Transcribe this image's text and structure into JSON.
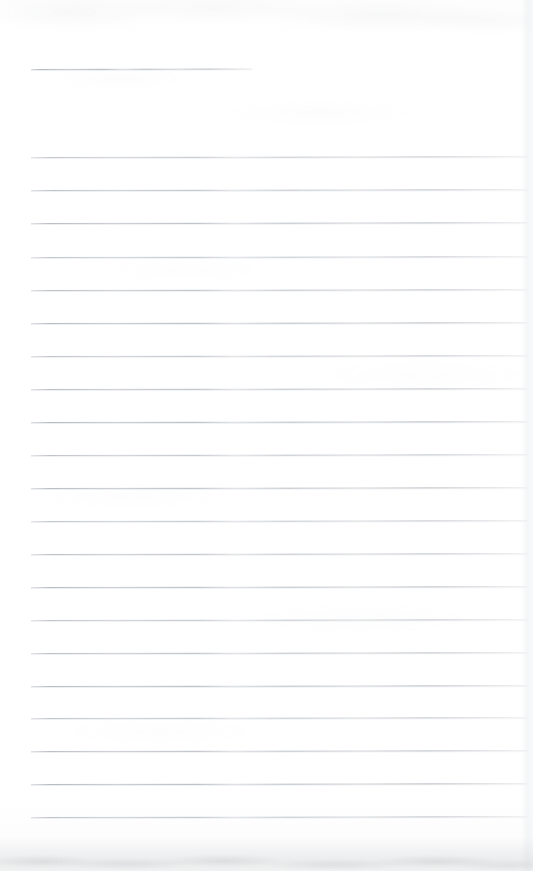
{
  "document": {
    "kind": "scanned-lined-page",
    "description": "Blank ruled notebook page scan",
    "page_width": 533,
    "page_height": 871,
    "paper_color": "#ffffff",
    "rule_color": "#b0b5bc",
    "rule_color_light": "#c4c8ce",
    "edge_shadow_color": "#a0a5ab"
  },
  "title_rule": {
    "name": "header-rule",
    "y": 69,
    "x_start": 31,
    "x_end": 252,
    "width": 221
  },
  "body_rules": {
    "count": 21,
    "x_start": 31,
    "x_end": 527,
    "width": 496,
    "spacing": 33.0,
    "first_y": 157,
    "last_y": 817,
    "y_positions": [
      157,
      190,
      223,
      257,
      290,
      323,
      356,
      389,
      422,
      455,
      488,
      521,
      554,
      587,
      620,
      653,
      686,
      718,
      751,
      784,
      817
    ]
  },
  "bottom_edge": {
    "name": "scan-bottom-edge",
    "y": 837,
    "height": 34
  }
}
